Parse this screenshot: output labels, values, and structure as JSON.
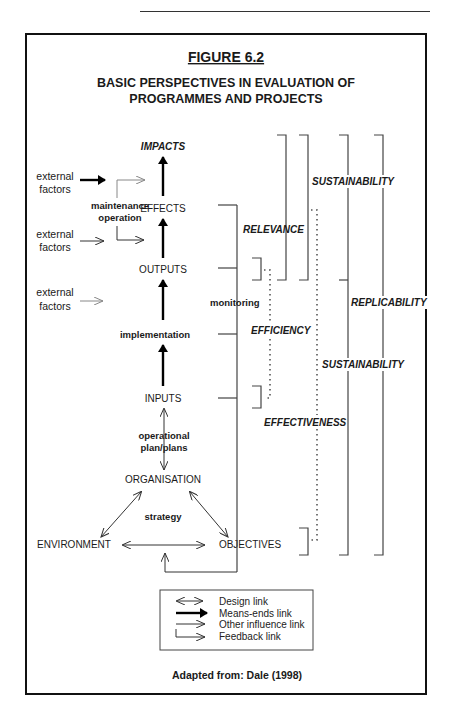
{
  "figure": {
    "label": "FIGURE 6.2",
    "title_line1": "BASIC PERSPECTIVES IN EVALUATION OF",
    "title_line2": "PROGRAMMES AND PROJECTS",
    "source": "Adapted from: Dale (1998)"
  },
  "chain": {
    "impacts": "IMPACTS",
    "effects": "EFFECTS",
    "outputs": "OUTPUTS",
    "implementation": "implementation",
    "inputs": "INPUTS",
    "operational_plan_line1": "operational",
    "operational_plan_line2": "plan/plans",
    "organisation": "ORGANISATION",
    "strategy": "strategy",
    "environment": "ENVIRONMENT",
    "objectives": "OBJECTIVES"
  },
  "external_factors": [
    {
      "line1": "external",
      "line2": "factors",
      "link": "means-ends"
    },
    {
      "line1": "external",
      "line2": "factors",
      "link": "other-influence"
    },
    {
      "line1": "external",
      "line2": "factors",
      "link": "other-influence-faint"
    }
  ],
  "maintenance": {
    "line1": "maintenance",
    "line2": "operation"
  },
  "monitoring": "monitoring",
  "perspectives": {
    "relevance": "RELEVANCE",
    "efficiency": "EFFICIENCY",
    "effectiveness": "EFFECTIVENESS",
    "sustainability_top": "SUSTAINABILITY",
    "sustainability_mid": "SUSTAINABILITY",
    "replicability": "REPLICABILITY"
  },
  "legend": {
    "items": [
      {
        "label": "Design link",
        "icon": "double-arrow-icon"
      },
      {
        "label": "Means-ends link",
        "icon": "thick-arrow-icon"
      },
      {
        "label": "Other influence link",
        "icon": "thin-arrow-icon"
      },
      {
        "label": "Feedback link",
        "icon": "feedback-arrow-icon"
      }
    ]
  }
}
